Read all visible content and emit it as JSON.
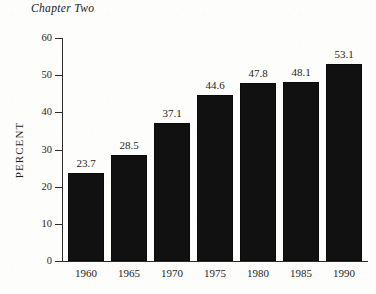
{
  "page": {
    "running_head": "Chapter Two",
    "background_color": "#fdfdfc",
    "ink_color": "#1d1d1b"
  },
  "chart_data": {
    "type": "bar",
    "title": "",
    "xlabel": "",
    "ylabel": "PERCENT",
    "categories": [
      "1960",
      "1965",
      "1970",
      "1975",
      "1980",
      "1985",
      "1990"
    ],
    "values": [
      23.7,
      28.5,
      37.1,
      44.6,
      47.8,
      48.1,
      53.1
    ],
    "value_labels": [
      "23.7",
      "28.5",
      "37.1",
      "44.6",
      "47.8",
      "48.1",
      "53.1"
    ],
    "ylim": [
      0,
      60
    ],
    "ytick_values": [
      0,
      10,
      20,
      30,
      40,
      50,
      60
    ],
    "ytick_labels": [
      "0",
      "10",
      "20",
      "30",
      "40",
      "50",
      "60"
    ],
    "grid": false,
    "legend": null,
    "bar_color": "#111111",
    "series": [
      {
        "name": "Percent",
        "values": [
          23.7,
          28.5,
          37.1,
          44.6,
          47.8,
          48.1,
          53.1
        ]
      }
    ]
  }
}
